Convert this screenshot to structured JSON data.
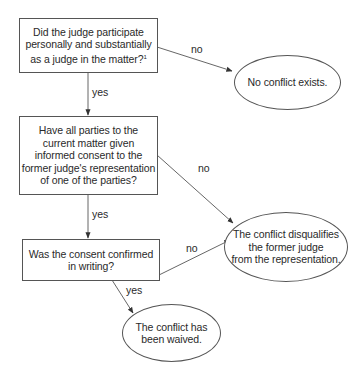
{
  "diagram": {
    "type": "flowchart",
    "colors": {
      "stroke": "#555555",
      "text": "#2a2a2a",
      "background": "#ffffff"
    },
    "nodes": {
      "q1": {
        "shape": "rectangle",
        "lines": [
          "Did the judge participate",
          "personally and substantially",
          "as a judge in the matter?"
        ],
        "footnote": "1"
      },
      "q2": {
        "shape": "rectangle",
        "lines": [
          "Have all parties to the",
          "current matter given",
          "informed consent to the",
          "former judge's representation",
          "of one of the parties?"
        ]
      },
      "q3": {
        "shape": "rectangle",
        "lines": [
          "Was the consent confirmed",
          "in writing?"
        ]
      },
      "no_conflict": {
        "shape": "ellipse",
        "lines": [
          "No conflict exists."
        ]
      },
      "disqualifies": {
        "shape": "ellipse",
        "lines": [
          "The conflict disqualifies",
          "the former judge",
          "from the representation."
        ]
      },
      "waived": {
        "shape": "ellipse",
        "lines": [
          "The conflict has",
          "been waived."
        ]
      }
    },
    "edges": {
      "q1_no": {
        "from": "q1",
        "to": "no_conflict",
        "label": "no"
      },
      "q1_yes": {
        "from": "q1",
        "to": "q2",
        "label": "yes"
      },
      "q2_no": {
        "from": "q2",
        "to": "disqualifies",
        "label": "no"
      },
      "q2_yes": {
        "from": "q2",
        "to": "q3",
        "label": "yes"
      },
      "q3_no": {
        "from": "q3",
        "to": "disqualifies",
        "label": "no"
      },
      "q3_yes": {
        "from": "q3",
        "to": "waived",
        "label": "yes"
      }
    }
  }
}
